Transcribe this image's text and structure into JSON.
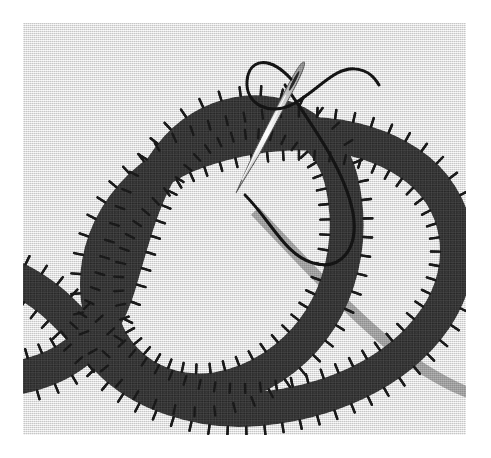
{
  "image": {
    "title": "Embroidered knot diagram with sewing needle",
    "subject": "knot-diagram-textile-illustration",
    "width": 491,
    "height": 458,
    "outer_background": "#ffffff"
  },
  "canvas": {
    "label": "fabric-panel",
    "x": 23,
    "y": 23,
    "width": 443,
    "height": 412,
    "fabric_color": "#dedede",
    "weave_light": "#f0f0f0",
    "weave_dark": "#c4c4c4"
  },
  "knot": {
    "label": "appliqued-knot-band",
    "band_color": "#2f2f2f",
    "band_width": 34,
    "stitch_color": "#161616",
    "stitch_length": 9,
    "stitch_thickness": 2.4,
    "stitch_spacing": 17,
    "description": "dark fabric band crossing itself to form an open knot with a left lobe and a right lobe",
    "strokes": [
      {
        "name": "main-knot-path",
        "path": "M -30 358 C 40 352 78 322 96 262 C 118 188 132 120 196 96 C 254 74 306 108 318 156 C 334 222 316 300 250 344 C 176 392 96 362 78 292 C 60 224 104 152 176 128 C 252 102 332 104 386 140 C 440 176 448 244 412 296 C 372 354 300 380 236 386 C 176 392 116 370 84 336 C 50 300 28 268 -20 250"
      }
    ]
  },
  "shadow_band": {
    "label": "gray-continuation-band",
    "color": "#8e8e8e",
    "width": 11,
    "path": "M 232 188 C 300 260 352 316 400 346 C 432 366 452 374 478 378"
  },
  "needle": {
    "label": "sewing-needle",
    "body_color": "#d8d8d8",
    "body_highlight": "#fbfbfb",
    "body_shadow": "#8e8e8e",
    "outline_color": "#4a4a4a",
    "eye_color": "#232323",
    "tip": {
      "x": 213,
      "y": 170
    },
    "head": {
      "x": 281,
      "y": 39
    },
    "length": 146,
    "max_width": 7
  },
  "thread": {
    "label": "black-thread",
    "color": "#111111",
    "width": 3.1,
    "paths": [
      {
        "name": "thread-upper-loop",
        "d": "M 268 56 C 246 32 226 36 224 58 C 222 82 248 94 272 80 C 296 66 312 44 332 46 C 346 47 352 55 356 62"
      },
      {
        "name": "thread-lower-loop",
        "d": "M 262 62 C 286 98 322 146 330 190 C 336 226 318 248 290 240 C 262 232 248 198 222 172"
      }
    ]
  },
  "palette": {
    "white": "#ffffff",
    "fabric": "#dedede",
    "band_dark": "#2f2f2f",
    "stitch_black": "#161616",
    "shadow_gray": "#8e8e8e",
    "needle_silver": "#d8d8d8",
    "thread_black": "#111111"
  }
}
